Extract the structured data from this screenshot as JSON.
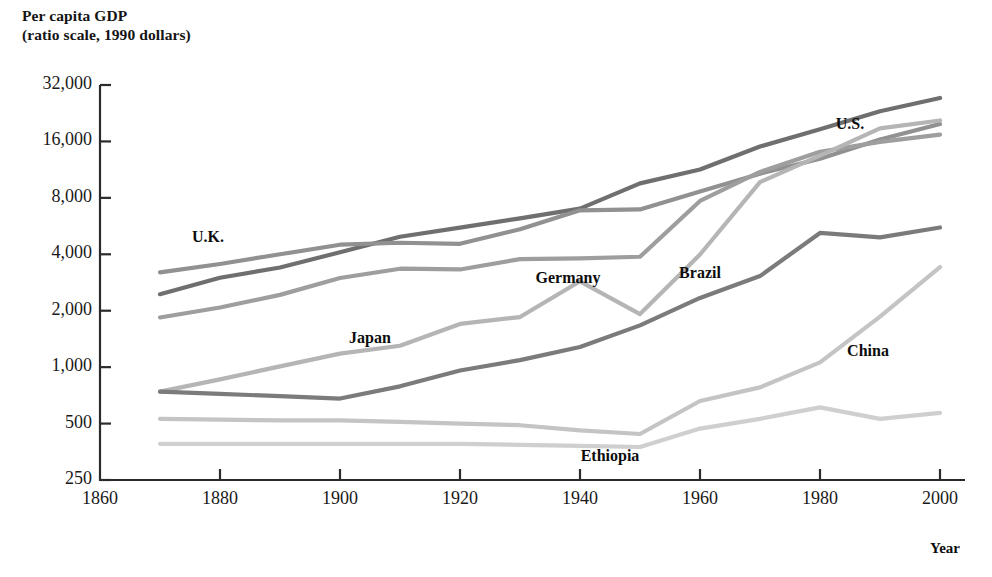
{
  "title": {
    "line1": "Per capita GDP",
    "line2": "(ratio scale, 1990 dollars)"
  },
  "axis": {
    "x_axis_label": "Year",
    "y_tick_labels": [
      "32,000",
      "16,000",
      "8,000",
      "4,000",
      "2,000",
      "1,000",
      "500",
      "250"
    ],
    "x_tick_labels": [
      "1860",
      "1880",
      "1900",
      "1920",
      "1940",
      "1960",
      "1980",
      "2000"
    ]
  },
  "chart_data": {
    "type": "line",
    "title": "Per capita GDP (ratio scale, 1990 dollars)",
    "xlabel": "Year",
    "ylabel": "Per capita GDP (ratio scale, 1990 dollars)",
    "yscale": "log",
    "ylim": [
      250,
      32000
    ],
    "xlim": [
      1860,
      2000
    ],
    "ytick_values": [
      32000,
      16000,
      8000,
      4000,
      2000,
      1000,
      500,
      250
    ],
    "xtick_values": [
      1860,
      1880,
      1900,
      1920,
      1940,
      1960,
      1980,
      2000
    ],
    "grid": false,
    "legend": "inline-labels",
    "series": [
      {
        "name": "U.S.",
        "color": "#6f6f6f",
        "label_x": 1985,
        "label_y": 19500,
        "x": [
          1870,
          1880,
          1890,
          1900,
          1910,
          1920,
          1930,
          1940,
          1950,
          1960,
          1970,
          1980,
          1990,
          2000
        ],
        "y": [
          2450,
          3000,
          3400,
          4100,
          4960,
          5550,
          6220,
          7010,
          9560,
          11330,
          15030,
          18580,
          23200,
          27300
        ]
      },
      {
        "name": "U.K.",
        "color": "#919191",
        "label_x": 1878,
        "label_y": 4900,
        "x": [
          1870,
          1880,
          1890,
          1900,
          1910,
          1920,
          1930,
          1940,
          1950,
          1960,
          1970,
          1980,
          1990,
          2000
        ],
        "y": [
          3200,
          3550,
          4000,
          4500,
          4610,
          4550,
          5440,
          6860,
          6940,
          8650,
          10770,
          12930,
          16400,
          19800
        ]
      },
      {
        "name": "Germany",
        "color": "#9e9e9e",
        "label_x": 1938,
        "label_y": 2950,
        "x": [
          1870,
          1880,
          1890,
          1900,
          1910,
          1920,
          1930,
          1940,
          1950,
          1960,
          1970,
          1980,
          1990,
          2000
        ],
        "y": [
          1840,
          2080,
          2430,
          2990,
          3350,
          3320,
          3770,
          3800,
          3880,
          7700,
          11000,
          14100,
          15900,
          17400
        ]
      },
      {
        "name": "Japan",
        "color": "#b5b5b5",
        "label_x": 1905,
        "label_y": 1420,
        "x": [
          1870,
          1880,
          1890,
          1900,
          1910,
          1920,
          1930,
          1940,
          1950,
          1960,
          1970,
          1980,
          1990,
          2000
        ],
        "y": [
          740,
          860,
          1010,
          1180,
          1300,
          1700,
          1850,
          2870,
          1920,
          3990,
          9710,
          13430,
          18790,
          20700
        ]
      },
      {
        "name": "Brazil",
        "color": "#7b7b7b",
        "label_x": 1960,
        "label_y": 3150,
        "x": [
          1870,
          1880,
          1890,
          1900,
          1910,
          1920,
          1930,
          1940,
          1950,
          1960,
          1970,
          1980,
          1990,
          2000
        ],
        "y": [
          740,
          720,
          700,
          680,
          790,
          960,
          1090,
          1280,
          1670,
          2340,
          3060,
          5200,
          4920,
          5560
        ]
      },
      {
        "name": "China",
        "color": "#c4c4c4",
        "label_x": 1988,
        "label_y": 1200,
        "x": [
          1870,
          1880,
          1890,
          1900,
          1910,
          1920,
          1930,
          1940,
          1950,
          1960,
          1970,
          1980,
          1990,
          2000
        ],
        "y": [
          530,
          525,
          520,
          520,
          510,
          500,
          490,
          460,
          440,
          660,
          780,
          1060,
          1860,
          3420
        ]
      },
      {
        "name": "Ethiopia",
        "color": "#cfcfcf",
        "label_x": 1945,
        "label_y": 330,
        "x": [
          1870,
          1880,
          1890,
          1900,
          1910,
          1920,
          1930,
          1940,
          1950,
          1960,
          1970,
          1980,
          1990,
          2000
        ],
        "y": [
          390,
          390,
          390,
          390,
          390,
          390,
          385,
          380,
          375,
          470,
          530,
          610,
          530,
          570
        ]
      }
    ]
  }
}
